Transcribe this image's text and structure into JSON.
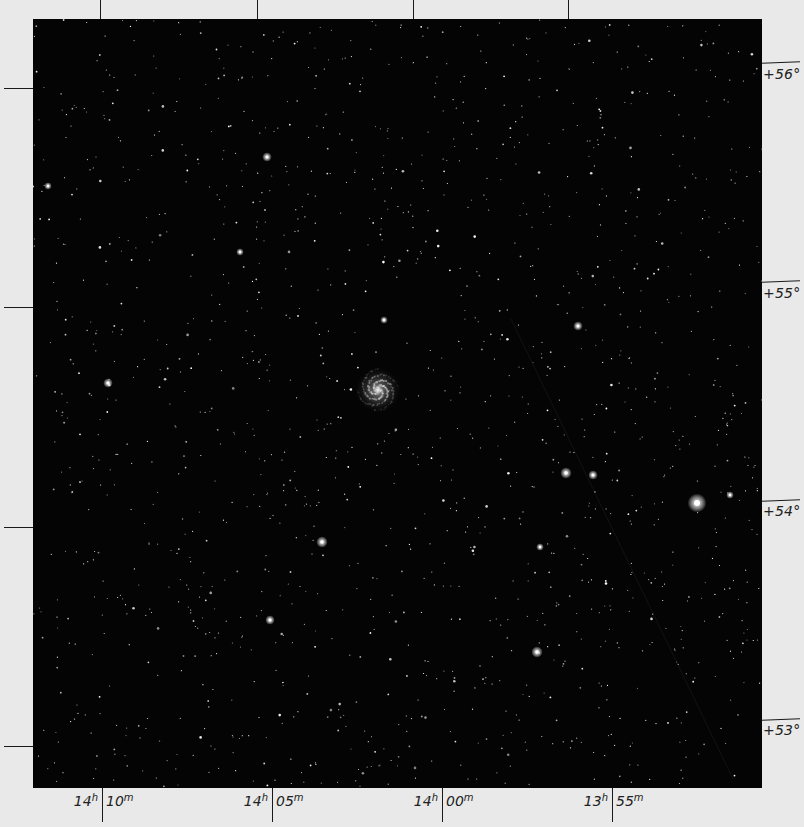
{
  "chart": {
    "title": "",
    "colors": {
      "sky": "#040404",
      "frame": "#e9e9e9",
      "ink": "#1a1a1a"
    }
  },
  "ra_axis": {
    "ticks": [
      {
        "hours": "14",
        "h_unit": "h",
        "minutes": "10",
        "m_unit": "m",
        "x": 102
      },
      {
        "hours": "14",
        "h_unit": "h",
        "minutes": "05",
        "m_unit": "m",
        "x": 272
      },
      {
        "hours": "14",
        "h_unit": "h",
        "minutes": "00",
        "m_unit": "m",
        "x": 442
      },
      {
        "hours": "13",
        "h_unit": "h",
        "minutes": "55",
        "m_unit": "m",
        "x": 612
      }
    ]
  },
  "dec_axis": {
    "ticks": [
      {
        "label": "+56°",
        "y": 62
      },
      {
        "label": "+55°",
        "y": 283
      },
      {
        "label": "+54°",
        "y": 503
      },
      {
        "label": "+53°",
        "y": 722
      }
    ]
  },
  "objects": {
    "galaxy": {
      "name": "spiral-galaxy",
      "x": 378,
      "y": 390
    },
    "bright_stars": [
      {
        "x": 697,
        "y": 503,
        "r": 5
      },
      {
        "x": 566,
        "y": 473,
        "r": 3
      },
      {
        "x": 593,
        "y": 475,
        "r": 2.5
      },
      {
        "x": 537,
        "y": 652,
        "r": 3
      },
      {
        "x": 540,
        "y": 547,
        "r": 2
      },
      {
        "x": 267,
        "y": 157,
        "r": 2.5
      },
      {
        "x": 270,
        "y": 620,
        "r": 2.5
      },
      {
        "x": 322,
        "y": 542,
        "r": 3
      },
      {
        "x": 578,
        "y": 326,
        "r": 2.5
      },
      {
        "x": 108,
        "y": 383,
        "r": 2.5
      },
      {
        "x": 48,
        "y": 186,
        "r": 2
      },
      {
        "x": 384,
        "y": 320,
        "r": 2
      },
      {
        "x": 240,
        "y": 252,
        "r": 2
      },
      {
        "x": 730,
        "y": 495,
        "r": 2
      }
    ]
  }
}
